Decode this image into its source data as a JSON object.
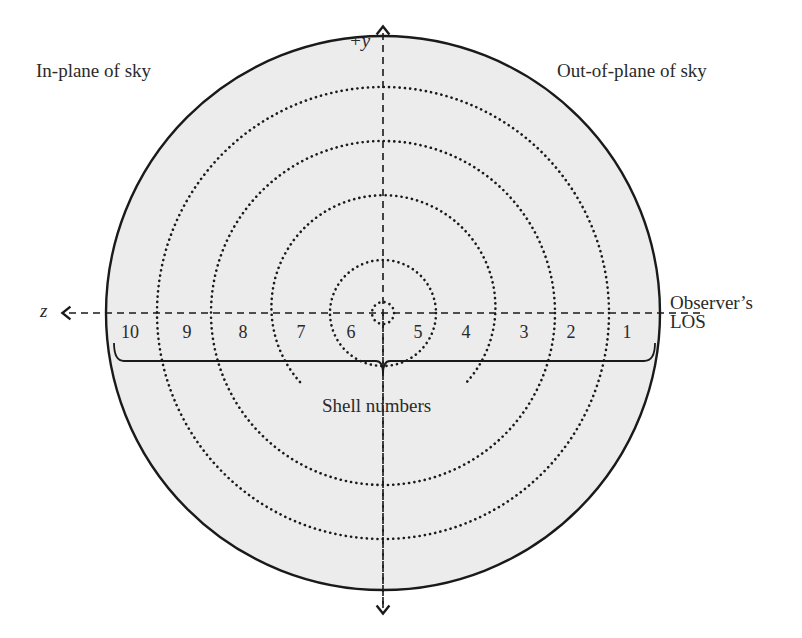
{
  "diagram": {
    "labels": {
      "in_plane": "In-plane of sky",
      "out_plane": "Out-of-plane of sky",
      "y_axis": "+y",
      "z_axis": "z",
      "observer_line1": "Observer’s",
      "observer_line2": "LOS",
      "shell_numbers": "Shell numbers"
    },
    "shells_left": [
      "10",
      "9",
      "8",
      "7",
      "6"
    ],
    "shells_right": [
      "5",
      "4",
      "3",
      "2",
      "1"
    ],
    "colors": {
      "sphere_fill": "#ececec",
      "line": "#1a1a1a"
    }
  }
}
